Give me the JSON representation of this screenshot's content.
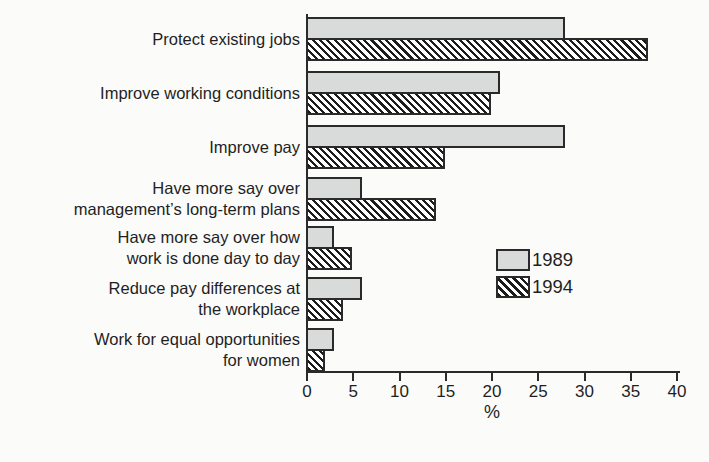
{
  "chart_data": {
    "type": "bar",
    "orientation": "horizontal",
    "title": "",
    "xlabel": "%",
    "xlim": [
      0,
      40
    ],
    "xticks": [
      0,
      5,
      10,
      15,
      20,
      25,
      30,
      35,
      40
    ],
    "grid": false,
    "legend_position": "center-right",
    "categories": [
      {
        "label": "Protect existing jobs",
        "lines": [
          "Protect existing jobs"
        ]
      },
      {
        "label": "Improve working conditions",
        "lines": [
          "Improve working conditions"
        ]
      },
      {
        "label": "Improve pay",
        "lines": [
          "Improve pay"
        ]
      },
      {
        "label": "Have more say over management’s long-term plans",
        "lines": [
          "Have more say over",
          "management’s long-term plans"
        ]
      },
      {
        "label": "Have more say over how work is done day to day",
        "lines": [
          "Have more say over how",
          "work is done day to day"
        ]
      },
      {
        "label": "Reduce pay differences at the workplace",
        "lines": [
          "Reduce pay differences at",
          "the workplace"
        ]
      },
      {
        "label": "Work for equal opportunities for women",
        "lines": [
          "Work for equal opportunities",
          "for women"
        ]
      }
    ],
    "series": [
      {
        "name": "1989",
        "style": "solid-gray",
        "values": [
          28,
          21,
          28,
          6,
          3,
          6,
          3
        ]
      },
      {
        "name": "1994",
        "style": "diagonal-hatch",
        "values": [
          37,
          20,
          15,
          14,
          5,
          4,
          2
        ]
      }
    ]
  },
  "colors": {
    "bar_fill_1989": "#d9dbda",
    "bar_hatch_stripe": "#1c1c1c",
    "bar_hatch_background": "#ffffff",
    "bar_border": "#2a2a2a",
    "axis": "#2a2a2a",
    "text": "#1f1f1f",
    "background": "#fbfbfa"
  }
}
